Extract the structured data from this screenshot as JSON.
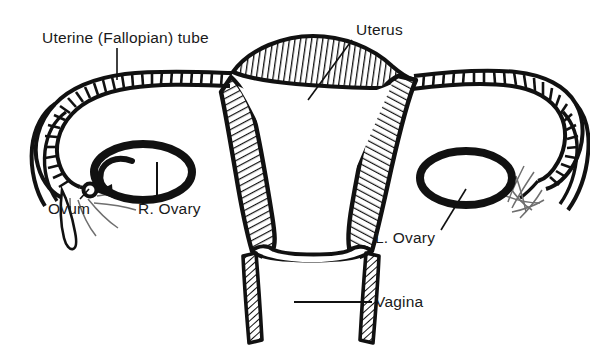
{
  "figure": {
    "type": "anatomical-line-drawing",
    "background_color": "#ffffff",
    "ink_color": "#111111",
    "width": 590,
    "height": 354
  },
  "labels": {
    "uterine_tube": "Uterine (Fallopian) tube",
    "uterus": "Uterus",
    "ovum": "Ovum",
    "right_ovary": "R. Ovary",
    "left_ovary": "L. Ovary",
    "vagina": "Vagina"
  },
  "structures": [
    {
      "name": "uterus-body",
      "label": "Uterus",
      "rendering": "cross-section with diagonal line hatching on the muscular wall and a white triangular cavity",
      "side": "center"
    },
    {
      "name": "uterine-fundus",
      "label": "Uterine (Fallopian) tube",
      "rendering": "lens-shaped hatched dome across the top of the uterus",
      "side": "center-top"
    },
    {
      "name": "uterine-tube-right",
      "label": "Uterine (Fallopian) tube",
      "rendering": "long ladder-hatched tube sweeping left then curving down and back",
      "side": "left"
    },
    {
      "name": "uterine-tube-left",
      "label": "Uterine (Fallopian) tube",
      "rendering": "long ladder-hatched tube sweeping right then curving down and back",
      "side": "right"
    },
    {
      "name": "fimbriae-right",
      "rendering": "fine open finger-like outlines at the free end of the tube",
      "side": "left"
    },
    {
      "name": "fimbriae-left",
      "rendering": "fine open finger-like outlines at the free end of the tube",
      "side": "right"
    },
    {
      "name": "right-ovary",
      "label": "R. Ovary",
      "rendering": "thick black oval ring",
      "side": "left"
    },
    {
      "name": "left-ovary",
      "label": "L. Ovary",
      "rendering": "thick black oval ring",
      "side": "right"
    },
    {
      "name": "ovum",
      "label": "Ovum",
      "rendering": "small open circle with a curved arrow leading from the right ovary toward the fimbriae",
      "side": "left"
    },
    {
      "name": "vagina",
      "label": "Vagina",
      "rendering": "downward canal with two hatched walls below the cervix",
      "side": "center-bottom"
    }
  ],
  "leader_lines": [
    {
      "for": "Uterine (Fallopian) tube",
      "style": "vertical",
      "from": "label-bottom",
      "to": "tube-wall"
    },
    {
      "for": "Uterus",
      "style": "diagonal",
      "from": "label-left",
      "to": "uterine-wall"
    },
    {
      "for": "Ovum",
      "style": "diagonal",
      "from": "label-top",
      "to": "ovum-circle"
    },
    {
      "for": "R. Ovary",
      "style": "vertical",
      "from": "label-top",
      "to": "right-ovary-ring"
    },
    {
      "for": "L. Ovary",
      "style": "diagonal",
      "from": "label-right",
      "to": "left-ovary-ring"
    },
    {
      "for": "Vagina",
      "style": "horizontal",
      "from": "label-left",
      "to": "vaginal-canal"
    }
  ]
}
